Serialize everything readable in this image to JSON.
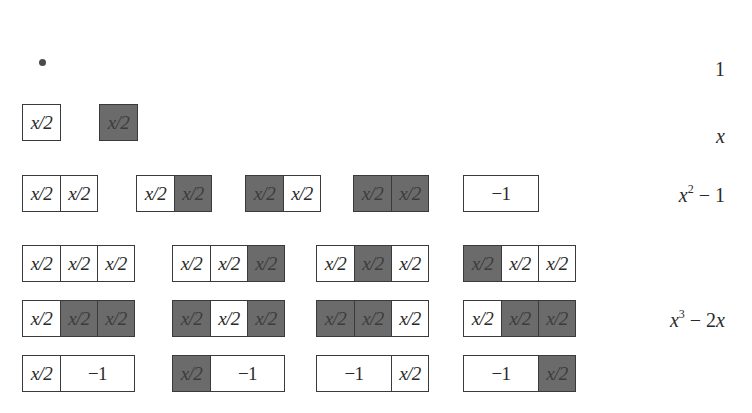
{
  "tile_labels": {
    "half_x": "x/2",
    "minus_one": "−1"
  },
  "colors": {
    "light_tile": "#ffffff",
    "dark_tile": "#6b6b6b",
    "border": "#3a3a3a"
  },
  "rows": [
    {
      "degree": 0,
      "polynomial": "1",
      "tilings": [
        {
          "type": "dot"
        }
      ]
    },
    {
      "degree": 1,
      "polynomial": "x",
      "tilings": [
        [
          "L"
        ],
        [
          "D"
        ]
      ]
    },
    {
      "degree": 2,
      "polynomial": "x² − 1",
      "tilings": [
        [
          "L",
          "L"
        ],
        [
          "L",
          "D"
        ],
        [
          "D",
          "L"
        ],
        [
          "D",
          "D"
        ],
        [
          "N"
        ]
      ]
    },
    {
      "degree": 3,
      "polynomial": "x³ − 2x",
      "tilings": [
        [
          "L",
          "L",
          "L"
        ],
        [
          "L",
          "L",
          "D"
        ],
        [
          "L",
          "D",
          "L"
        ],
        [
          "D",
          "L",
          "L"
        ],
        [
          "L",
          "D",
          "D"
        ],
        [
          "D",
          "L",
          "D"
        ],
        [
          "D",
          "D",
          "L"
        ],
        [
          "L",
          "D",
          "D"
        ],
        [
          "L",
          "N"
        ],
        [
          "D",
          "N"
        ],
        [
          "N",
          "L"
        ],
        [
          "N",
          "D"
        ]
      ]
    }
  ],
  "legend": {
    "L": "white x/2 tile",
    "D": "shaded x/2 tile",
    "N": "−1 tile (length 2)"
  },
  "labels": {
    "p0": "1",
    "p1_var": "x",
    "p2_var": "x",
    "p2_exp": "2",
    "p2_rest": " − 1",
    "p3_var": "x",
    "p3_exp": "3",
    "p3_rest": " − 2",
    "p3_tail": "x"
  }
}
